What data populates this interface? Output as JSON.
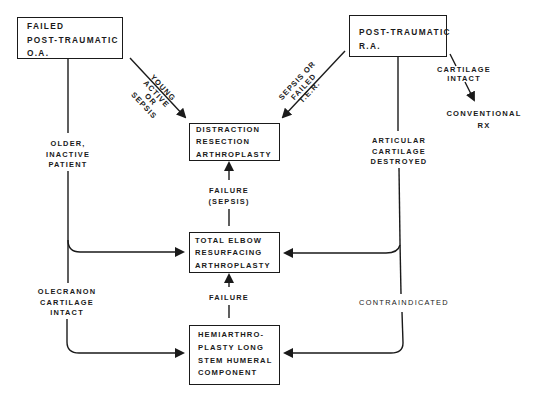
{
  "nodes": {
    "failed_oa": {
      "lines": [
        "FAILED",
        "POST-TRAUMATIC",
        "O.A."
      ]
    },
    "post_ra": {
      "lines": [
        "POST-TRAUMATIC",
        "R.A."
      ]
    },
    "distraction": {
      "lines": [
        "DISTRACTION",
        "RESECTION",
        "ARTHROPLASTY"
      ]
    },
    "total_elbow": {
      "lines": [
        "TOTAL ELBOW",
        "RESURFACING",
        "ARTHROPLASTY"
      ]
    },
    "hemi": {
      "lines": [
        "HEMIARTHRO-",
        "PLASTY LONG",
        "STEM HUMERAL",
        "COMPONENT"
      ]
    },
    "conventional": {
      "lines": [
        "CONVENTIONAL",
        "RX"
      ]
    }
  },
  "edge_labels": {
    "young_active": {
      "lines": [
        "YOUNG",
        "ACTIVE",
        "OR",
        "SEPSIS"
      ]
    },
    "sepsis_failed": {
      "lines": [
        "SEPSIS OR",
        "FAILED",
        "T.E.R."
      ]
    },
    "cartilage_intact": {
      "lines": [
        "CARTILAGE",
        "INTACT"
      ]
    },
    "older_inactive": {
      "lines": [
        "OLDER,",
        "INACTIVE",
        "PATIENT"
      ]
    },
    "articular_destroyed": {
      "lines": [
        "ARTICULAR",
        "CARTILAGE",
        "DESTROYED"
      ]
    },
    "failure_sepsis": {
      "lines": [
        "FAILURE",
        "(SEPSIS)"
      ]
    },
    "failure": {
      "lines": [
        "FAILURE"
      ]
    },
    "olecranon_intact": {
      "lines": [
        "OLECRANON",
        "CARTILAGE",
        "INTACT"
      ]
    },
    "contraindicated": {
      "lines": [
        "CONTRAINDICATED"
      ]
    }
  },
  "colors": {
    "ink": "#1a1a1a",
    "background": "#ffffff"
  }
}
